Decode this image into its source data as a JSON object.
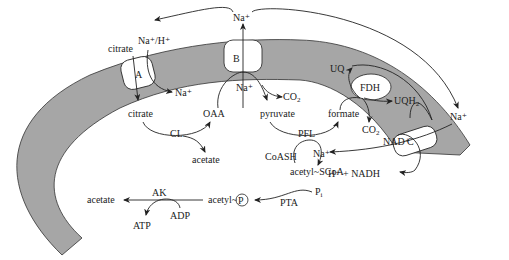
{
  "diagram": {
    "membrane_color": "#a6a6a6",
    "transporters": [
      {
        "id": "A",
        "label": "A",
        "substrate_out": "citrate",
        "ion": "Na⁺/H⁺"
      },
      {
        "id": "B",
        "label": "B",
        "ion_in": "Na⁺",
        "ion_out": "Na⁺"
      },
      {
        "id": "C",
        "label": "C",
        "ion_out": "Na⁺"
      },
      {
        "id": "FDH",
        "label": "FDH"
      }
    ],
    "labels": {
      "citrate_out": "citrate",
      "na_h": "Na⁺/H⁺",
      "na_top": "Na⁺",
      "box_a": "A",
      "box_b": "B",
      "box_c": "C",
      "fdh": "FDH",
      "na_a_out": "Na⁺",
      "na_b_in": "Na⁺",
      "co2_b": "CO",
      "co2_b_sub": "2",
      "citrate_in": "citrate",
      "oaa": "OAA",
      "pyruvate": "pyruvate",
      "formate": "formate",
      "cl": "CL",
      "acetate_cl": "acetate",
      "pfl": "PFL",
      "coash": "CoASH",
      "acetyl_scoa": "acetyl~SCoA",
      "uq": "UQ",
      "uqh": "UQH",
      "uqh_sub": "2",
      "co2_fdh": "CO",
      "co2_fdh_sub": "2",
      "nad": "NAD⁺",
      "na_right": "Na⁺",
      "na_c_out": "Na⁺",
      "h_nadh": "H⁺ + NADH",
      "pi": "P",
      "pi_sub": "i",
      "pta": "PTA",
      "acetyl_p": "acetyl~",
      "p_circle": "P",
      "ak": "AK",
      "acetate_ak": "acetate",
      "adp": "ADP",
      "atp": "ATP"
    }
  }
}
